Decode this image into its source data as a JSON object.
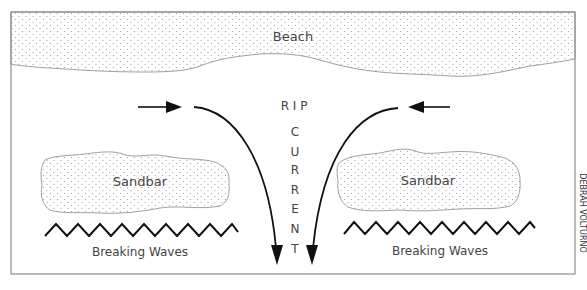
{
  "diagram": {
    "labels": {
      "beach": "Beach",
      "sandbar_left": "Sandbar",
      "sandbar_right": "Sandbar",
      "waves_left": "Breaking Waves",
      "waves_right": "Breaking Waves",
      "rip_current_letters": [
        "R I P",
        "C",
        "U",
        "R",
        "R",
        "E",
        "N",
        "T"
      ],
      "credit": "DEBRAH VOLTURNO"
    },
    "colors": {
      "stroke": "#111111",
      "outline": "#888888",
      "dots": "#999999",
      "text": "#444444"
    }
  }
}
